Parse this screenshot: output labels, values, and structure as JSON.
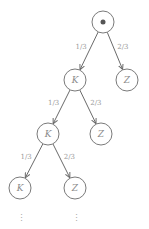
{
  "diagram": {
    "type": "probability-tree",
    "root": {
      "id": "root",
      "label": "",
      "marker": "filled-dot"
    },
    "nodes": [
      {
        "id": "root",
        "label": ""
      },
      {
        "id": "k1",
        "label": "K"
      },
      {
        "id": "z1",
        "label": "Z"
      },
      {
        "id": "k2",
        "label": "K"
      },
      {
        "id": "z2",
        "label": "Z"
      },
      {
        "id": "k3",
        "label": "K"
      },
      {
        "id": "z3",
        "label": "Z"
      }
    ],
    "edges": [
      {
        "from": "root",
        "to": "k1",
        "label": "1/3"
      },
      {
        "from": "root",
        "to": "z1",
        "label": "2/3"
      },
      {
        "from": "k1",
        "to": "k2",
        "label": "1/3"
      },
      {
        "from": "k1",
        "to": "z2",
        "label": "2/3"
      },
      {
        "from": "k2",
        "to": "k3",
        "label": "1/3"
      },
      {
        "from": "k2",
        "to": "z3",
        "label": "2/3"
      }
    ],
    "continuation": [
      {
        "below": "k3",
        "text": "⋮"
      },
      {
        "below": "z3",
        "text": "⋮"
      }
    ]
  }
}
